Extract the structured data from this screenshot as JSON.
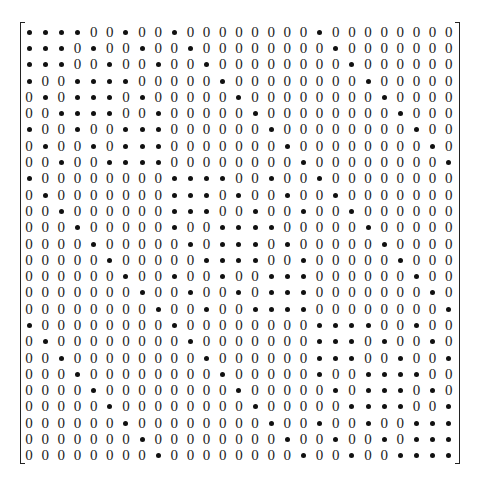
{
  "matrix": {
    "rows": 27,
    "cols": 27,
    "zero_symbol": "0",
    "dot_symbol": "•",
    "data": [
      "111100100100000000100000000",
      "111010010010000000010000000",
      "111001001001000000001000000",
      "100111100000100000000100000",
      "010111010000010000000010000",
      "001111001000001000000001000",
      "100100111000000100000000100",
      "010010111000000010000000010",
      "001001111000000001000000001",
      "100000000111100100100000000",
      "010000000111010010010000000",
      "001000000111001001001000000",
      "000100000100111100000100000",
      "000010000010111010000010000",
      "000001000001111001000001000",
      "000000100100100111000000100",
      "000000010010010111000000010",
      "000000001001001111000000001",
      "100000000100000000111100100",
      "010000000010000000111010010",
      "001000000001000000111001001",
      "000100000000100000100111100",
      "000010000000010000010111010",
      "000001000000001000001111001",
      "000000100000000100100100111",
      "000000010000000010010010111",
      "000000001000000001001001111"
    ]
  }
}
